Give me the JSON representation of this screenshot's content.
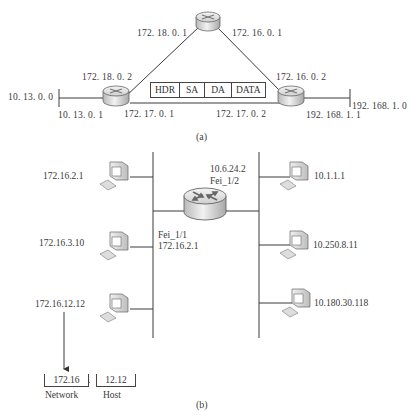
{
  "figure_a": {
    "caption": "(a)",
    "routers": [
      {
        "id": "left-router",
        "labels": {
          "top": "172. 18. 0. 2",
          "bottom_left": "10. 13. 0. 1",
          "bottom_right": "172. 17. 0. 1"
        }
      },
      {
        "id": "top-router",
        "labels": {
          "left": "172. 18. 0. 1",
          "right": "172. 16. 0. 1"
        }
      },
      {
        "id": "right-router",
        "labels": {
          "top": "172. 16. 0. 2",
          "bottom_left": "172. 17. 0. 2",
          "bottom_right": "192. 168. 1. 1"
        }
      }
    ],
    "networks": {
      "left": "10. 13. 0. 0",
      "right": "192. 168. 1. 0"
    },
    "packet": {
      "fields": [
        "HDR",
        "SA",
        "DA",
        "DATA"
      ]
    }
  },
  "figure_b": {
    "caption": "(b)",
    "router": {
      "interface_right": {
        "ip": "10.6.24.2",
        "name": "Fei_1/2"
      },
      "interface_left": {
        "name": "Fei_1/1",
        "ip": "172.16.2.1"
      }
    },
    "left_hosts": [
      "172.16.2.1",
      "172.16.3.10",
      "172.16.12.12"
    ],
    "right_hosts": [
      "10.1.1.1",
      "10.250.8.11",
      "10.180.30.118"
    ],
    "address_breakdown": {
      "network_part": "172.16",
      "separator": ".",
      "host_part": "12.12",
      "network_label": "Network",
      "host_label": "Host"
    }
  }
}
